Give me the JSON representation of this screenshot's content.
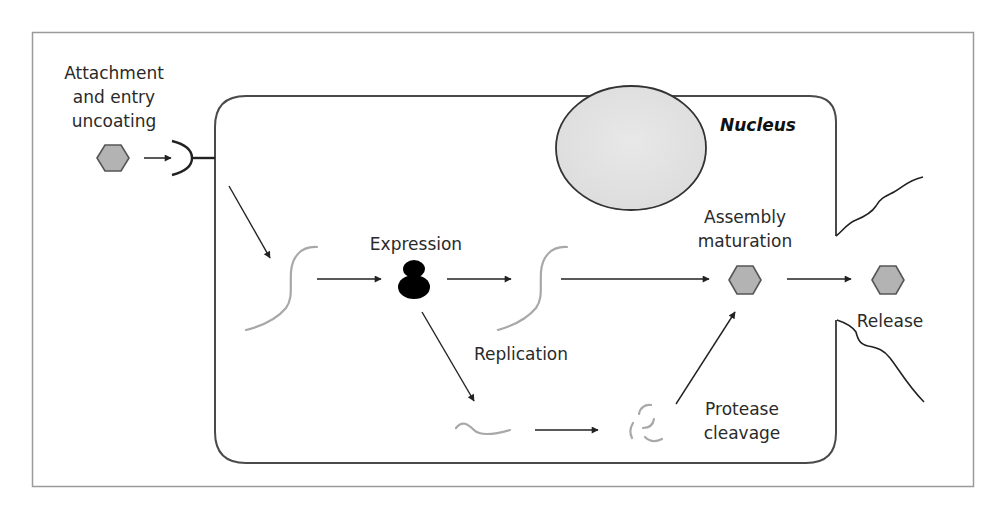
{
  "diagram": {
    "type": "virus-replication-cycle",
    "colors": {
      "frame": "#9a9a9a",
      "membrane": "#4a4a4a",
      "nucleus_fill": "#e2e2e2",
      "nucleus_stroke": "#333333",
      "virion_fill": "#b3b3b3",
      "virion_stroke": "#555555",
      "nucleic_acid": "#a8a8a8",
      "arrow": "#222222",
      "ribosome": "#000000"
    },
    "labels": {
      "attachment": [
        "Attachment",
        "and entry",
        "uncoating"
      ],
      "nucleus": "Nucleus",
      "expression": "Expression",
      "replication": "Replication",
      "assembly": [
        "Assembly",
        "maturation"
      ],
      "release": "Release",
      "protease": [
        "Protease",
        "cleavage"
      ]
    },
    "nodes": [
      {
        "id": "virion-outside",
        "shape": "hexagon",
        "label": "Attachment and entry uncoating"
      },
      {
        "id": "receptor",
        "shape": "receptor-cup"
      },
      {
        "id": "genome-1",
        "shape": "nucleic-acid-strand"
      },
      {
        "id": "ribosome",
        "shape": "ribosome",
        "label": "Expression"
      },
      {
        "id": "genome-2",
        "shape": "nucleic-acid-strand"
      },
      {
        "id": "polyprotein",
        "shape": "protein-strand",
        "label": "Replication"
      },
      {
        "id": "cleaved-protein",
        "shape": "protein-fragments",
        "label": "Protease cleavage"
      },
      {
        "id": "virion-assembled",
        "shape": "hexagon",
        "label": "Assembly maturation"
      },
      {
        "id": "virion-released",
        "shape": "hexagon",
        "label": "Release"
      },
      {
        "id": "nucleus",
        "shape": "ellipse",
        "label": "Nucleus"
      }
    ],
    "edges": [
      {
        "from": "virion-outside",
        "to": "receptor"
      },
      {
        "from": "receptor",
        "to": "genome-1"
      },
      {
        "from": "genome-1",
        "to": "ribosome"
      },
      {
        "from": "ribosome",
        "to": "genome-2"
      },
      {
        "from": "genome-2",
        "to": "virion-assembled"
      },
      {
        "from": "ribosome",
        "to": "polyprotein"
      },
      {
        "from": "polyprotein",
        "to": "cleaved-protein"
      },
      {
        "from": "cleaved-protein",
        "to": "virion-assembled"
      },
      {
        "from": "virion-assembled",
        "to": "virion-released"
      }
    ]
  }
}
